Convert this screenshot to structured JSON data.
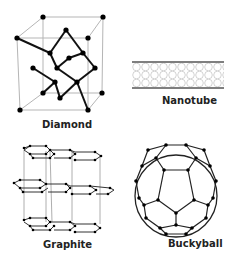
{
  "figure": {
    "panels": [
      {
        "id": "diamond",
        "label": "Diamond"
      },
      {
        "id": "nanotube",
        "label": "Nanotube"
      },
      {
        "id": "graphite",
        "label": "Graphite"
      },
      {
        "id": "buckyball",
        "label": "Buckyball"
      }
    ]
  },
  "colors": {
    "bond": "#111111",
    "cell_edge": "#b0b0b0",
    "atom": "#000000",
    "background": "#ffffff"
  }
}
